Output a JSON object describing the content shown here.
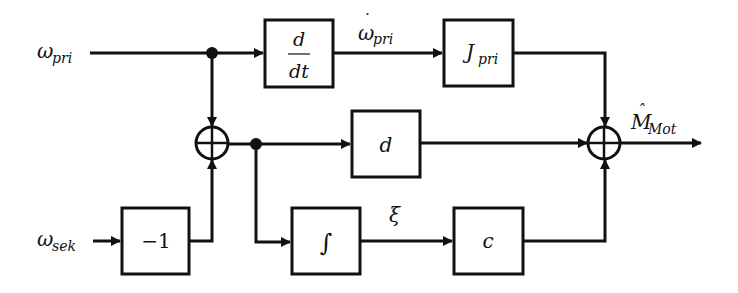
{
  "diagram": {
    "type": "block-diagram",
    "inputs": {
      "omega_pri": {
        "base": "ω",
        "sub": "pri"
      },
      "omega_sek": {
        "base": "ω",
        "sub": "sek"
      }
    },
    "output": {
      "base": "M",
      "sub": "Mot",
      "accent": "ˆ"
    },
    "signals": {
      "omega_dot_pri": {
        "base": "ω",
        "sub": "pri",
        "accent": "˙"
      },
      "xi": "ξ"
    },
    "blocks": {
      "derivative": {
        "num": "d",
        "den": "dt"
      },
      "inertia": {
        "base": "J",
        "sub": "pri"
      },
      "damping": "d",
      "negate": "−1",
      "integrator": "∫",
      "stiffness": "c"
    },
    "summing_junctions": [
      {
        "id": "sum1",
        "symbol": "+"
      },
      {
        "id": "sum2",
        "symbol": "+"
      }
    ],
    "colors": {
      "line": "#111111",
      "background": "#ffffff"
    }
  }
}
